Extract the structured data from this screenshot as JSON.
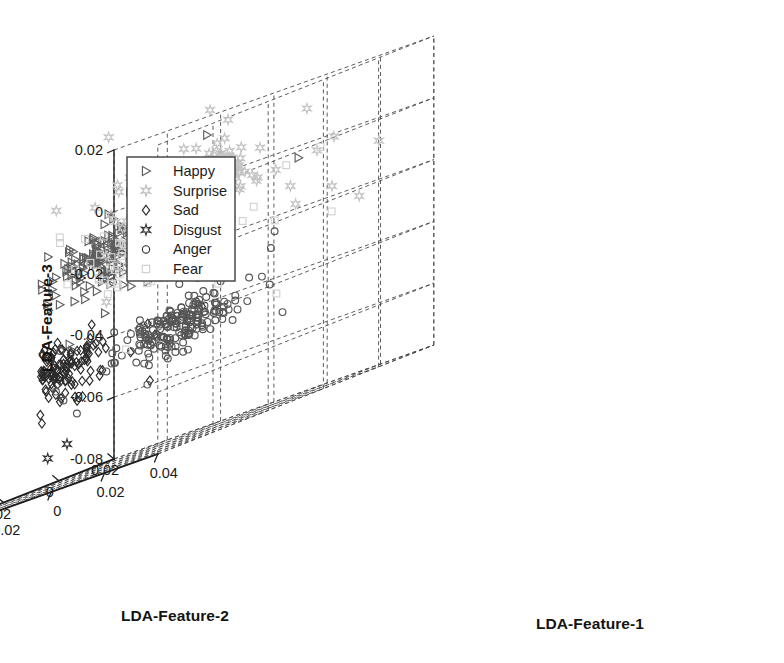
{
  "figure": {
    "kind": "3d-scatter",
    "background": "#ffffff",
    "width": 784,
    "height": 663
  },
  "chart_data": {
    "type": "scatter",
    "projection": "3d",
    "title": "",
    "xlabel": "LDA-Feature-1",
    "ylabel": "LDA-Feature-2",
    "zlabel": "LDA-Feature-3",
    "grid": true,
    "legend_position": "upper-left",
    "xlim": [
      -0.08,
      0.04
    ],
    "ylim": [
      -0.08,
      0.02
    ],
    "zlim": [
      -0.08,
      0.02
    ],
    "xticks": [
      "-0.08",
      "-0.06",
      "-0.04",
      "-0.02",
      "0",
      "0.02",
      "0.04"
    ],
    "xtick_values": [
      -0.08,
      -0.06,
      -0.04,
      -0.02,
      0,
      0.02,
      0.04
    ],
    "yticks": [
      "0.02",
      "0",
      "-0.02",
      "-0.04",
      "-0.06",
      "-0.08"
    ],
    "ytick_values": [
      0.02,
      0,
      -0.02,
      -0.04,
      -0.06,
      -0.08
    ],
    "zticks": [
      "0.02",
      "0",
      "-0.02",
      "-0.04",
      "-0.06",
      "-0.08"
    ],
    "ztick_values": [
      0.02,
      0,
      -0.02,
      -0.04,
      -0.06,
      -0.08
    ],
    "series": [
      {
        "name": "Happy",
        "marker": "right-triangle",
        "color": "#5e5e5e",
        "n": 210,
        "center": [
          -0.044,
          -0.016,
          -0.012
        ],
        "spread": [
          0.01,
          0.009,
          0.0055
        ],
        "seed": 11
      },
      {
        "name": "Surprise",
        "marker": "star",
        "color": "#c3c3c3",
        "n": 200,
        "center": [
          0.004,
          -0.03,
          0.001
        ],
        "spread": [
          0.009,
          0.008,
          0.006
        ],
        "seed": 23
      },
      {
        "name": "Sad",
        "marker": "diamond",
        "color": "#2b2b2b",
        "n": 200,
        "center": [
          -0.035,
          -0.047,
          -0.043
        ],
        "spread": [
          0.0085,
          0.0085,
          0.005
        ],
        "seed": 37
      },
      {
        "name": "Disgust",
        "marker": "hexagram",
        "color": "#333333",
        "n": 215,
        "center": [
          -0.046,
          -0.07,
          -0.074
        ],
        "spread": [
          0.009,
          0.0085,
          0.0045
        ],
        "seed": 51
      },
      {
        "name": "Anger",
        "marker": "circle",
        "color": "#555555",
        "n": 205,
        "center": [
          0.01,
          -0.043,
          -0.042
        ],
        "spread": [
          0.0095,
          0.0085,
          0.005
        ],
        "seed": 67
      },
      {
        "name": "Fear",
        "marker": "square",
        "color": "#d2d2d2",
        "n": 190,
        "center": [
          -0.018,
          -0.024,
          -0.016
        ],
        "spread": [
          0.0085,
          0.008,
          0.0055
        ],
        "seed": 83
      }
    ]
  },
  "legend": {
    "items": [
      {
        "label": "Happy",
        "marker": "right-triangle",
        "color": "#5e5e5e"
      },
      {
        "label": "Surprise",
        "marker": "star",
        "color": "#bdbdbd"
      },
      {
        "label": "Sad",
        "marker": "diamond",
        "color": "#2b2b2b"
      },
      {
        "label": "Disgust",
        "marker": "hexagram",
        "color": "#333333"
      },
      {
        "label": "Anger",
        "marker": "circle",
        "color": "#333333"
      },
      {
        "label": "Fear",
        "marker": "square",
        "color": "#cfcfcf"
      }
    ]
  }
}
